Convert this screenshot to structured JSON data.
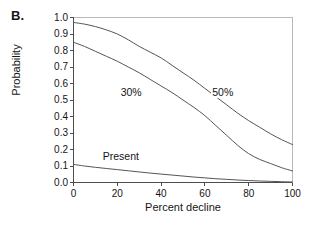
{
  "panel": {
    "label": "B."
  },
  "axes": {
    "xlabel": "Percent decline",
    "ylabel": "Probability",
    "xticks": [
      "0",
      "20",
      "40",
      "60",
      "80",
      "100"
    ],
    "yticks": [
      "1.0",
      "0.9",
      "0.8",
      "0.7",
      "0.6",
      "0.5",
      "0.4",
      "0.3",
      "0.2",
      "0.1",
      "0.0"
    ],
    "xlim": [
      0,
      100
    ],
    "ylim": [
      0,
      1
    ]
  },
  "annotations": {
    "curve_30": "30%",
    "curve_50": "50%",
    "curve_present": "Present"
  },
  "colors": {
    "line": "#555555",
    "axis": "#4d4d4d",
    "text": "#151515",
    "background": "#ffffff"
  },
  "chart_data": {
    "type": "line",
    "title": "",
    "xlabel": "Percent decline",
    "ylabel": "Probability",
    "xlim": [
      0,
      100
    ],
    "ylim": [
      0,
      1
    ],
    "grid": false,
    "legend": "inline-curve-labels",
    "x": [
      0,
      5,
      10,
      15,
      20,
      25,
      30,
      35,
      40,
      45,
      50,
      55,
      60,
      65,
      70,
      75,
      80,
      85,
      90,
      95,
      100
    ],
    "series": [
      {
        "name": "50%",
        "label": "50%",
        "values": [
          0.97,
          0.96,
          0.945,
          0.925,
          0.9,
          0.865,
          0.825,
          0.79,
          0.755,
          0.71,
          0.665,
          0.62,
          0.57,
          0.52,
          0.47,
          0.42,
          0.375,
          0.335,
          0.295,
          0.26,
          0.23
        ]
      },
      {
        "name": "30%",
        "label": "30%",
        "values": [
          0.85,
          0.825,
          0.795,
          0.765,
          0.735,
          0.7,
          0.665,
          0.625,
          0.585,
          0.545,
          0.5,
          0.455,
          0.405,
          0.345,
          0.285,
          0.225,
          0.175,
          0.14,
          0.115,
          0.09,
          0.07
        ]
      },
      {
        "name": "Present",
        "label": "Present",
        "values": [
          0.11,
          0.1,
          0.092,
          0.085,
          0.078,
          0.071,
          0.064,
          0.057,
          0.051,
          0.045,
          0.039,
          0.033,
          0.028,
          0.023,
          0.019,
          0.015,
          0.012,
          0.009,
          0.007,
          0.005,
          0.003
        ]
      }
    ]
  }
}
